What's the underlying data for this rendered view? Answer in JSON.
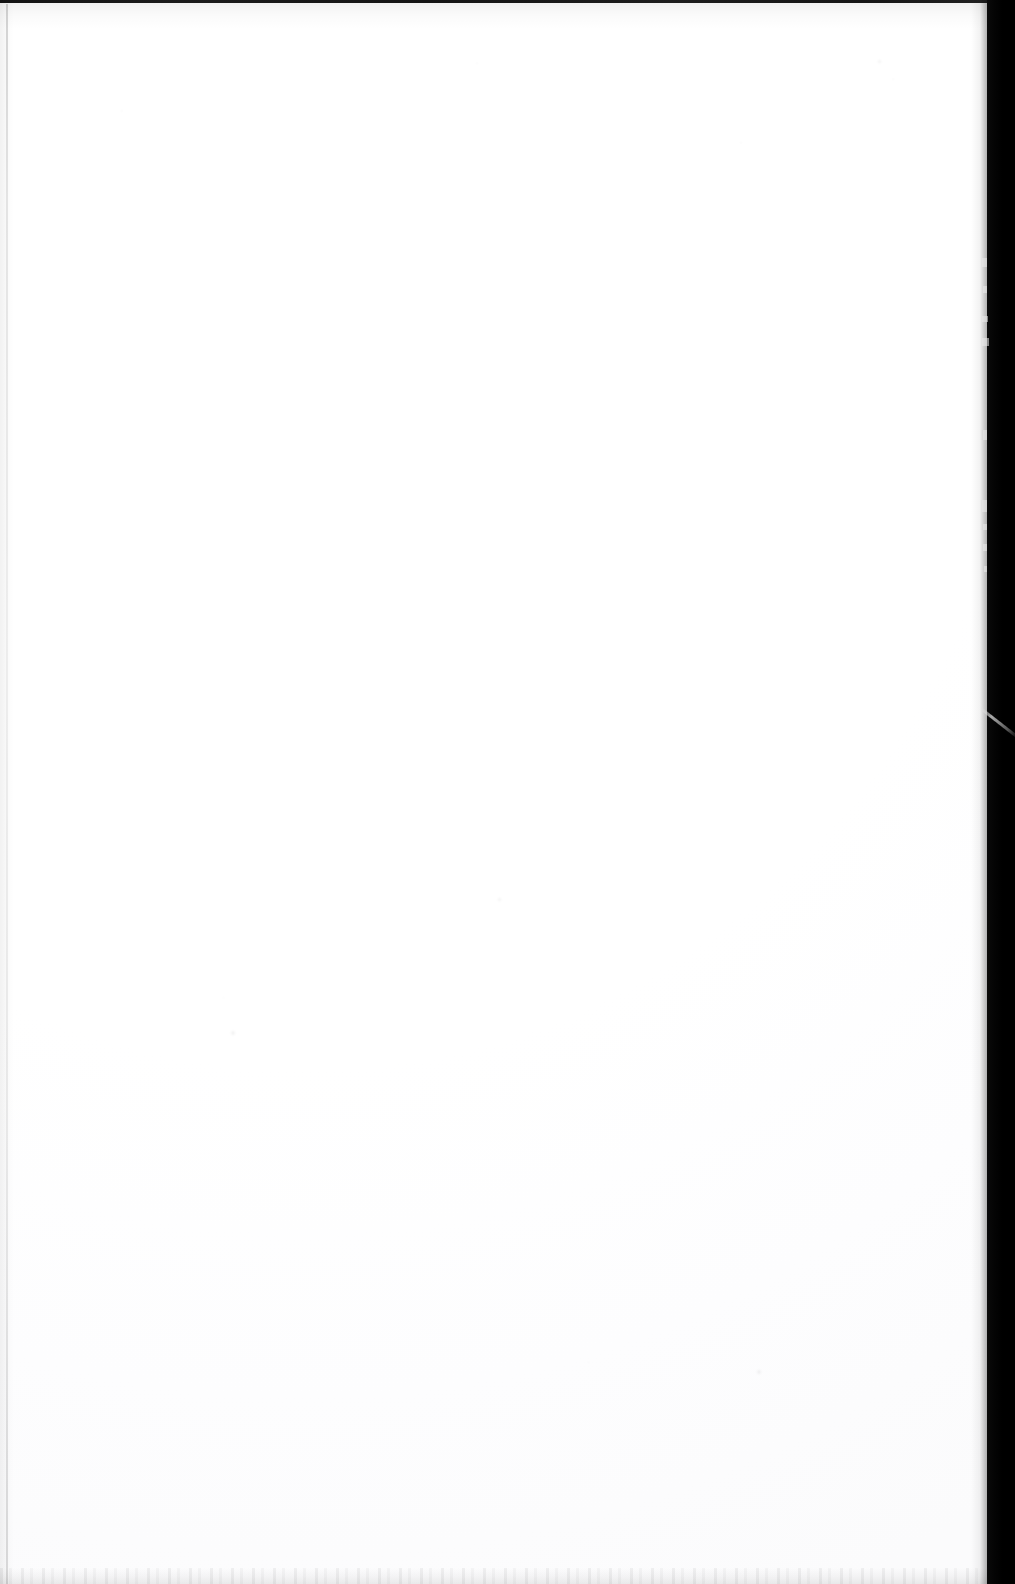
{
  "document": {
    "kind": "scanned-page",
    "content_text": "",
    "page_state_label": "blank",
    "width_px": 1015,
    "height_px": 1584
  },
  "colors": {
    "paper": "#ffffff",
    "paper_shadow": "#fafafb",
    "top_rule": "#131313",
    "left_margin_line": "#d9d9d9",
    "gutter_band": "#000000",
    "speck": "#f2f2f2"
  },
  "artifacts": {
    "top_edge_line": {
      "label": "top-edge-rule",
      "y": 0,
      "height": 3
    },
    "left_margin_line": {
      "label": "left-margin-line",
      "x": 6,
      "width": 2
    },
    "bottom_speckle_band": {
      "label": "bottom-speckle-band",
      "height": 16
    },
    "right_gutter": {
      "label": "right-gutter-shadow",
      "width": 28
    },
    "gutter_streak": {
      "label": "gutter-light-streak",
      "y": 700
    },
    "nicks": [
      {
        "y": 258,
        "w": 5,
        "h": 9
      },
      {
        "y": 286,
        "w": 4,
        "h": 7
      },
      {
        "y": 316,
        "w": 6,
        "h": 6
      },
      {
        "y": 338,
        "w": 7,
        "h": 8
      },
      {
        "y": 430,
        "w": 4,
        "h": 10
      },
      {
        "y": 500,
        "w": 5,
        "h": 12
      },
      {
        "y": 524,
        "w": 4,
        "h": 6
      },
      {
        "y": 544,
        "w": 4,
        "h": 7
      },
      {
        "y": 566,
        "w": 3,
        "h": 6
      }
    ],
    "specks": [
      {
        "x": 231,
        "y": 1031,
        "size": 4
      },
      {
        "x": 757,
        "y": 1370,
        "size": 4
      },
      {
        "x": 498,
        "y": 898,
        "size": 3
      },
      {
        "x": 878,
        "y": 60,
        "size": 3
      }
    ]
  }
}
